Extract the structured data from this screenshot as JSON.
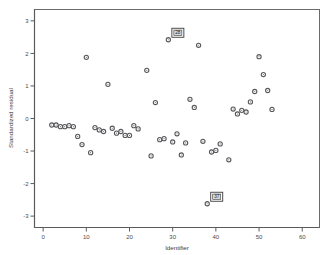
{
  "chart_data": {
    "type": "scatter",
    "title": "",
    "xlabel": "Identifier",
    "ylabel": "Standardized residual",
    "xlim": [
      -2,
      64
    ],
    "ylim": [
      -3.35,
      3.35
    ],
    "xticks": [
      0,
      10,
      20,
      30,
      40,
      50,
      60
    ],
    "yticks": [
      -3,
      -2,
      -1,
      0,
      1,
      2,
      3
    ],
    "xtick_labels": [
      "0",
      "10",
      "20",
      "30",
      "40",
      "50",
      "60"
    ],
    "ytick_labels": [
      "-3",
      "-2",
      "-1",
      "0",
      "1",
      "2",
      "3"
    ],
    "grid": false,
    "legend": false,
    "marker": "open-circle",
    "series": [
      {
        "name": "Standardized residual",
        "x": [
          2,
          3,
          4,
          5,
          6,
          7,
          8,
          9,
          10,
          11,
          12,
          13,
          14,
          15,
          16,
          17,
          18,
          19,
          20,
          21,
          22,
          24,
          25,
          26,
          27,
          28,
          29,
          30,
          31,
          32,
          33,
          34,
          35,
          36,
          37,
          38,
          39,
          40,
          41,
          43,
          44,
          45,
          46,
          47,
          48,
          49,
          50,
          51,
          52,
          53
        ],
        "y": [
          -0.2,
          -0.2,
          -0.25,
          -0.25,
          -0.22,
          -0.25,
          -0.55,
          -0.8,
          1.88,
          -1.05,
          -0.28,
          -0.35,
          -0.4,
          1.05,
          -0.3,
          -0.45,
          -0.4,
          -0.52,
          -0.52,
          -0.22,
          -0.32,
          1.48,
          -1.15,
          0.49,
          -0.65,
          -0.62,
          2.42,
          -0.72,
          -0.47,
          -1.12,
          -0.75,
          0.59,
          0.34,
          2.25,
          -0.7,
          -2.62,
          -1.03,
          -0.98,
          -0.78,
          -1.27,
          0.29,
          0.14,
          0.25,
          0.2,
          0.51,
          0.83,
          1.9,
          1.35,
          0.86,
          0.28
        ],
        "color": "#58585c"
      }
    ],
    "annotations": [
      {
        "label": "28",
        "x": 29,
        "y": 2.42,
        "position": "upper-right"
      },
      {
        "label": "37",
        "x": 38,
        "y": -2.62,
        "position": "upper-right"
      }
    ]
  },
  "axes": {
    "x_title": "Identifier",
    "y_title": "Standardized residual"
  }
}
